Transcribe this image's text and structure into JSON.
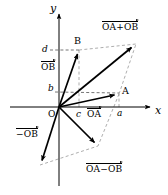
{
  "figure": {
    "background_color": "#ffffff",
    "stroke_color": "#000000",
    "dashed_color": "#808080",
    "width": 168,
    "height": 195
  },
  "axes": {
    "x_label": "x",
    "y_label": "y",
    "origin_label": "O",
    "x_axis": {
      "from": [
        10,
        107
      ],
      "to": [
        152,
        107
      ]
    },
    "y_axis": {
      "from": [
        59,
        186
      ],
      "to": [
        59,
        12
      ]
    }
  },
  "ticks": [
    {
      "name": "tick-a",
      "label": "a",
      "x": 119,
      "y": 113,
      "axis": "x"
    },
    {
      "name": "tick-b",
      "label": "b",
      "x": 48,
      "y": 92,
      "axis": "y"
    },
    {
      "name": "tick-c",
      "label": "c",
      "x": 80,
      "y": 113,
      "axis": "x"
    },
    {
      "name": "tick-d",
      "label": "d",
      "x": 43,
      "y": 54,
      "axis": "y"
    }
  ],
  "points": [
    {
      "name": "point-A",
      "label": "A",
      "x": 123,
      "y": 92
    },
    {
      "name": "point-B",
      "label": "B",
      "x": 76,
      "y": 42
    }
  ],
  "vectors": [
    {
      "name": "vector-OA",
      "label": "OA",
      "label_x": 86,
      "label_y": 110,
      "from": [
        59,
        107
      ],
      "to": [
        119,
        94
      ]
    },
    {
      "name": "vector-OB",
      "label": "OB",
      "label_x": 44,
      "label_y": 62,
      "from": [
        59,
        107
      ],
      "to": [
        79,
        50
      ]
    },
    {
      "name": "vector-OA-plus-OB",
      "label": "OA+OB",
      "label_x": 105,
      "label_y": 22,
      "from": [
        59,
        107
      ],
      "to": [
        136,
        44
      ]
    },
    {
      "name": "vector-OA-minus-OB",
      "label": "OA−OB",
      "label_x": 88,
      "label_y": 168,
      "from": [
        59,
        107
      ],
      "to": [
        98,
        146
      ]
    },
    {
      "name": "vector-minus-OB",
      "label": "−OB",
      "label_x": 17,
      "label_y": 129,
      "from": [
        59,
        107
      ],
      "to": [
        40,
        165
      ]
    }
  ],
  "dashed_guides": [
    {
      "name": "guide-B-to-sum",
      "from": [
        79,
        50
      ],
      "to": [
        136,
        44
      ]
    },
    {
      "name": "guide-A-to-sum",
      "from": [
        119,
        94
      ],
      "to": [
        136,
        44
      ]
    },
    {
      "name": "guide-d-to-B",
      "from": [
        50,
        50
      ],
      "to": [
        79,
        50
      ]
    },
    {
      "name": "guide-b-to-A",
      "from": [
        55,
        92
      ],
      "to": [
        119,
        94
      ]
    },
    {
      "name": "guide-c-vertical",
      "from": [
        79,
        107
      ],
      "to": [
        79,
        50
      ]
    },
    {
      "name": "guide-a-vertical",
      "from": [
        119,
        107
      ],
      "to": [
        119,
        94
      ]
    },
    {
      "name": "guide-minusOB-to-diff",
      "from": [
        40,
        165
      ],
      "to": [
        98,
        146
      ]
    },
    {
      "name": "guide-A-to-diff",
      "from": [
        119,
        94
      ],
      "to": [
        98,
        146
      ]
    }
  ]
}
